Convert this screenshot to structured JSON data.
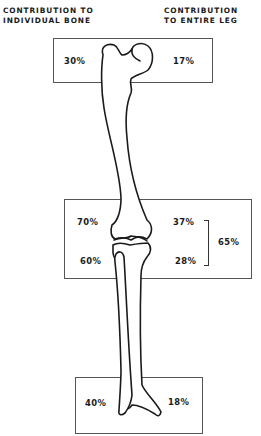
{
  "headers": {
    "left": [
      "CONTRIBUTION TO",
      "INDIVIDUAL BONE"
    ],
    "right": [
      "CONTRIBUTION",
      "TO ENTIRE LEG"
    ]
  },
  "regions": {
    "proximal_femur": {
      "individual_bone": "30%",
      "entire_leg": "17%"
    },
    "knee": {
      "distal_femur": {
        "individual_bone": "70%",
        "entire_leg": "37%"
      },
      "proximal_tibia": {
        "individual_bone": "60%",
        "entire_leg": "28%"
      },
      "combined_entire_leg": "65%"
    },
    "distal_tibia": {
      "individual_bone": "40%",
      "entire_leg": "18%"
    }
  },
  "colors": {
    "line": "#1a1a1a",
    "box": "#555555",
    "background": "#ffffff"
  }
}
